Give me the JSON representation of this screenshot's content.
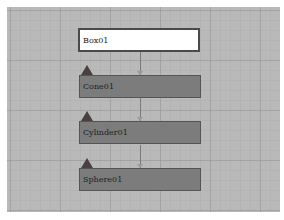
{
  "schematic": {
    "nodes": [
      {
        "label": "Box01",
        "selected": true
      },
      {
        "label": "Cone01",
        "selected": false
      },
      {
        "label": "Cylinder01",
        "selected": false
      },
      {
        "label": "Sphere01",
        "selected": false
      }
    ]
  },
  "colors": {
    "canvas": "#b9b9b9",
    "node_fill": "#7c7c7c",
    "selected_fill": "#ffffff",
    "node_marker": "#4a4040"
  }
}
